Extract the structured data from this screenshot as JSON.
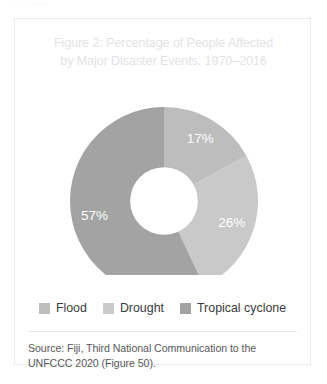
{
  "page": {
    "top_cut_text": "· ·· ··· ··"
  },
  "figure": {
    "title": "Figure 2: Percentage of People Affected by Major Disaster Events, 1970–2016",
    "title_line1": "Figure 2: Percentage of People Affected",
    "title_line2": "by Major Disaster Events, 1970–2016",
    "title_color": "#e3e3e5",
    "source_note": "Source: Fiji, Third National Communication to the UNFCCC 2020 (Figure 50).",
    "source_line1": "Source: Fiji, Third National Communication to the UNFCCC",
    "source_line2": "2020 (Figure 50)."
  },
  "chart_data": {
    "type": "pie",
    "variant": "donut",
    "title": "Figure 2: Percentage of People Affected by Major Disaster Events, 1970–2016",
    "xlabel": "",
    "ylabel": "",
    "unit": "%",
    "legend_position": "bottom",
    "grid": false,
    "start_angle_deg": 0,
    "direction": "clockwise",
    "inner_radius_ratio": 0.36,
    "categories": [
      "Flood",
      "Drought",
      "Tropical cyclone"
    ],
    "values": [
      17,
      26,
      57
    ],
    "labels": [
      "17%",
      "26%",
      "57%"
    ],
    "colors": [
      "#bdbdbd",
      "#c9c9c9",
      "#a3a3a3"
    ],
    "label_color": "#ffffff",
    "slices": [
      {
        "name": "Flood",
        "value": 17,
        "label": "17%",
        "color": "#bdbdbd"
      },
      {
        "name": "Drought",
        "value": 26,
        "label": "26%",
        "color": "#c9c9c9"
      },
      {
        "name": "Tropical cyclone",
        "value": 57,
        "label": "57%",
        "color": "#a3a3a3"
      }
    ]
  },
  "legend": {
    "items": [
      {
        "label": "Flood",
        "color": "#bdbdbd"
      },
      {
        "label": "Drought",
        "color": "#c9c9c9"
      },
      {
        "label": "Tropical cyclone",
        "color": "#a3a3a3"
      }
    ]
  }
}
